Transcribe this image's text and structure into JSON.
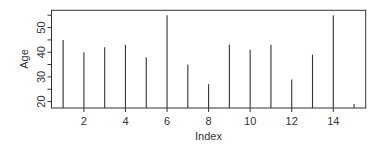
{
  "chart_data": {
    "type": "bar",
    "style": "histogram-lines",
    "title": "",
    "xlabel": "Index",
    "ylabel": "Age",
    "x": [
      1,
      2,
      3,
      4,
      5,
      6,
      7,
      8,
      9,
      10,
      11,
      12,
      13,
      14,
      15
    ],
    "values": [
      45,
      40,
      42,
      43,
      38,
      55,
      35,
      27,
      43,
      41,
      43,
      29,
      39,
      55,
      19
    ],
    "xlim": [
      0.44,
      15.56
    ],
    "ylim": [
      17.4,
      57.0
    ],
    "xticks": [
      2,
      4,
      6,
      8,
      10,
      12,
      14
    ],
    "yticks": [
      20,
      25,
      30,
      35,
      40,
      45,
      50,
      55
    ],
    "ytick_labels": [
      "20",
      "",
      "30",
      "",
      "40",
      "",
      "50",
      ""
    ],
    "grid": false,
    "legend": null,
    "colors": {
      "line": "#333333",
      "frame": "#333333",
      "text": "#333333"
    }
  },
  "axes": {
    "xlabel": "Index",
    "ylabel": "Age"
  }
}
